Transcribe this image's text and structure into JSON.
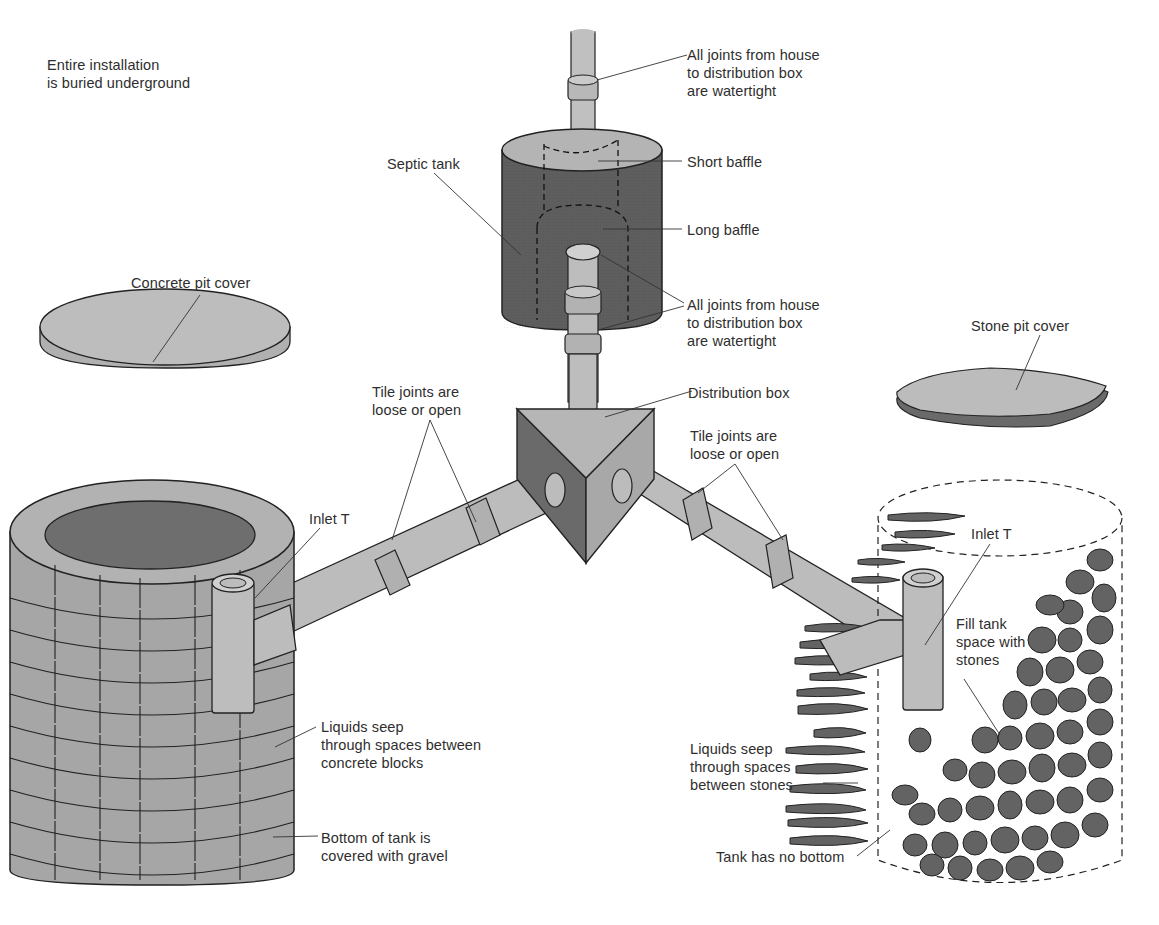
{
  "diagram": {
    "colors": {
      "background": "#ffffff",
      "dark_fill": "#5e5e5e",
      "mid_fill": "#9c9c9c",
      "light_fill": "#c4c4c4",
      "stone_fill": "#626262",
      "outline": "#222222",
      "text": "#2e2e2e"
    },
    "labels": {
      "installation_note": "Entire installation\nis buried underground",
      "joints_watertight_top": "All joints from house\nto distribution box\nare watertight",
      "short_baffle": "Short baffle",
      "septic_tank": "Septic tank",
      "long_baffle": "Long baffle",
      "joints_watertight_mid": "All joints from house\nto distribution box\nare watertight",
      "concrete_pit_cover": "Concrete pit cover",
      "stone_pit_cover": "Stone pit cover",
      "distribution_box": "Distribution box",
      "tile_joints_left": "Tile joints are\nloose or open",
      "tile_joints_right": "Tile joints are\nloose or open",
      "inlet_t_left": "Inlet T",
      "inlet_t_right": "Inlet T",
      "liquids_seep_blocks": "Liquids seep\nthrough spaces between\nconcrete blocks",
      "bottom_gravel": "Bottom of tank is\ncovered with gravel",
      "fill_tank_stones": "Fill tank\nspace with\nstones",
      "liquids_seep_stones": "Liquids seep\nthrough spaces\nbetween stones",
      "tank_no_bottom": "Tank has no bottom"
    },
    "components": [
      {
        "id": "house-inlet-pipe",
        "name": "Pipe from house"
      },
      {
        "id": "septic-tank",
        "name": "Septic tank"
      },
      {
        "id": "distribution-box",
        "name": "Distribution box"
      },
      {
        "id": "left-drain-pipe",
        "name": "Drain tile to concrete block pit"
      },
      {
        "id": "right-drain-pipe",
        "name": "Drain tile to stone pit"
      },
      {
        "id": "concrete-block-pit",
        "name": "Concrete block seepage pit"
      },
      {
        "id": "stone-pit",
        "name": "Stone-filled seepage pit"
      },
      {
        "id": "concrete-pit-cover",
        "name": "Concrete pit cover"
      },
      {
        "id": "stone-pit-cover",
        "name": "Stone pit cover"
      }
    ]
  }
}
